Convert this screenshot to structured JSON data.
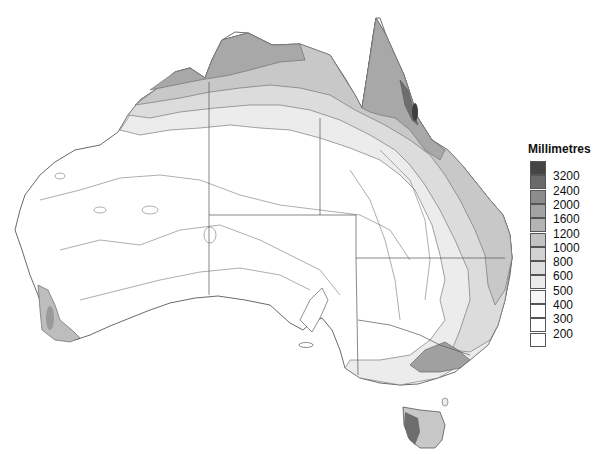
{
  "legend": {
    "title": "Millimetres",
    "labels": [
      "3200",
      "2400",
      "2000",
      "1600",
      "1200",
      "1000",
      "800",
      "600",
      "500",
      "400",
      "300",
      "200"
    ],
    "swatch_colors": [
      "#454545",
      "#6a6a6a",
      "#8c8c8c",
      "#a3a3a3",
      "#b4b4b4",
      "#c3c3c3",
      "#d2d2d2",
      "#dedede",
      "#ebebeb",
      "#f6f6f6",
      "#ffffff",
      "#ffffff",
      "#ffffff"
    ]
  },
  "chart_data": {
    "type": "heatmap",
    "title": "",
    "legend_title": "Millimetres",
    "bins_mm": [
      200,
      300,
      400,
      500,
      600,
      800,
      1000,
      1200,
      1600,
      2000,
      2400,
      3200
    ],
    "legend_position": "right",
    "regions": [
      {
        "name": "Cape York / Far North Queensland coast",
        "approx_range_mm": "1600-3200+"
      },
      {
        "name": "Top End (NT north)",
        "approx_range_mm": "1200-1600"
      },
      {
        "name": "Kimberley coast",
        "approx_range_mm": "800-1200"
      },
      {
        "name": "Central / Western interior",
        "approx_range_mm": "200-300"
      },
      {
        "name": "South-west WA corner",
        "approx_range_mm": "800-1200"
      },
      {
        "name": "Eastern coast NSW/QLD",
        "approx_range_mm": "800-1600"
      },
      {
        "name": "Victorian Alps",
        "approx_range_mm": "1200-2400"
      },
      {
        "name": "Western Tasmania",
        "approx_range_mm": "1600-2400"
      }
    ]
  }
}
